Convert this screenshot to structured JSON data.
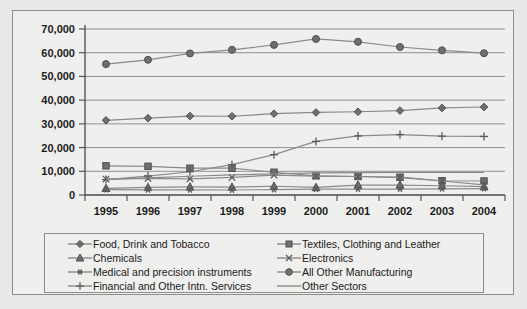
{
  "chart_data": {
    "type": "line",
    "title": "",
    "xlabel": "",
    "ylabel": "",
    "categories": [
      "1995",
      "1996",
      "1997",
      "1998",
      "1999",
      "2000",
      "2001",
      "2002",
      "2003",
      "2004"
    ],
    "ylim": [
      0,
      70000
    ],
    "ytick_values": [
      0,
      10000,
      20000,
      30000,
      40000,
      50000,
      60000,
      70000
    ],
    "ytick_labels": [
      "0",
      "10,000",
      "20,000",
      "30,000",
      "40,000",
      "50,000",
      "60,000",
      "70,000"
    ],
    "grid": true,
    "legend_position": "bottom",
    "series": [
      {
        "name": "Food, Drink and Tobacco",
        "marker": "diamond",
        "values": [
          31500,
          32400,
          33300,
          33200,
          34300,
          34800,
          35100,
          35600,
          36700,
          37100
        ]
      },
      {
        "name": "Textiles, Clothing and Leather",
        "marker": "square",
        "values": [
          12300,
          12100,
          11300,
          11300,
          9600,
          8100,
          7800,
          7500,
          6000,
          5900
        ]
      },
      {
        "name": "Chemicals",
        "marker": "triangle",
        "values": [
          2800,
          3200,
          3400,
          3300,
          3700,
          3200,
          4200,
          4200,
          3900,
          3500
        ]
      },
      {
        "name": "Electronics",
        "marker": "x",
        "values": [
          6700,
          7000,
          6800,
          7400,
          8400,
          8000,
          7800,
          7300,
          5900,
          4300
        ]
      },
      {
        "name": "Medical and precision instruments",
        "marker": "asterisk",
        "values": [
          2300,
          2200,
          2200,
          2100,
          2300,
          2500,
          2500,
          2500,
          2600,
          2700
        ]
      },
      {
        "name": "All Other Manufacturing",
        "marker": "circle",
        "values": [
          55200,
          57000,
          59700,
          61200,
          63300,
          65800,
          64600,
          62400,
          61000,
          59800
        ]
      },
      {
        "name": "Financial and Other Intn. Services",
        "marker": "plus",
        "values": [
          6500,
          8000,
          9800,
          12800,
          17000,
          22600,
          24900,
          25500,
          24800,
          24700
        ]
      },
      {
        "name": "Other Sectors",
        "marker": "line",
        "values": [
          6600,
          7200,
          7900,
          8500,
          8900,
          9300,
          9400,
          9500,
          9500,
          9500
        ]
      }
    ]
  },
  "legend": {
    "entries": [
      {
        "label": "Food, Drink and Tobacco",
        "marker": "diamond",
        "column": 1,
        "row": 1
      },
      {
        "label": "Textiles, Clothing and Leather",
        "marker": "square",
        "column": 2,
        "row": 1
      },
      {
        "label": "Chemicals",
        "marker": "triangle",
        "column": 1,
        "row": 2
      },
      {
        "label": "Electronics",
        "marker": "x",
        "column": 2,
        "row": 2
      },
      {
        "label": "Medical and precision instruments",
        "marker": "asterisk",
        "column": 1,
        "row": 3
      },
      {
        "label": "All Other Manufacturing",
        "marker": "circle",
        "column": 2,
        "row": 3
      },
      {
        "label": "Financial and Other Intn. Services",
        "marker": "plus",
        "column": 1,
        "row": 4
      },
      {
        "label": "Other Sectors",
        "marker": "line",
        "column": 2,
        "row": 4
      }
    ]
  },
  "colors": {
    "series_line": "#8a8a8a",
    "marker_fill": "#6f6f6f",
    "marker_stroke": "#4e4e4e",
    "gridline": "#8f8f8f",
    "axis": "#4a4a4a",
    "plot_background": "#efefed",
    "page_background": "#e8e8e6",
    "border": "#8d8d8d",
    "text": "#1c1c1c"
  }
}
